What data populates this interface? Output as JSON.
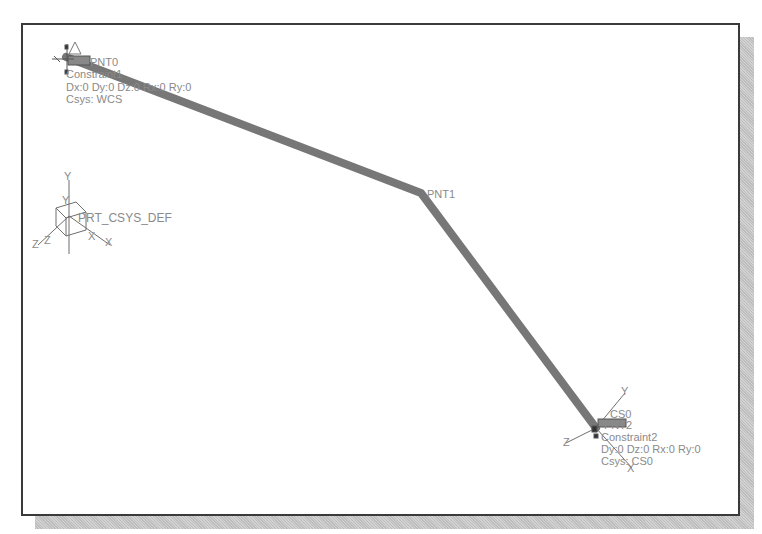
{
  "diagram": {
    "colors": {
      "frame": "#3a3a3a",
      "beam": "#777777",
      "label": "#8a8a8a",
      "csys": "#6e6e6e"
    },
    "beam_points": [
      {
        "name": "PNT0",
        "x": 66,
        "y": 57
      },
      {
        "name": "PNT1",
        "x": 421,
        "y": 193
      },
      {
        "name": "PNT2",
        "x": 596,
        "y": 428
      }
    ],
    "labels": {
      "pnt0": "PNT0",
      "constraint1_name": "Constraint1",
      "constraint1_dofs": "Dx:0 Dy:0 Dz:0 Rx:0 Ry:0",
      "constraint1_csys": "Csys: WCS",
      "pnt1": "PNT1",
      "prt_csys": "PRT_CSYS_DEF",
      "cs0": "CS0",
      "pnt2": "PNT2",
      "constraint2_name": "Constraint2",
      "constraint2_dofs": "Dy:0 Dz:0 Rx:0 Ry:0",
      "constraint2_csys": "Csys: CS0",
      "axis_x": "X",
      "axis_y": "Y",
      "axis_z": "Z"
    }
  }
}
